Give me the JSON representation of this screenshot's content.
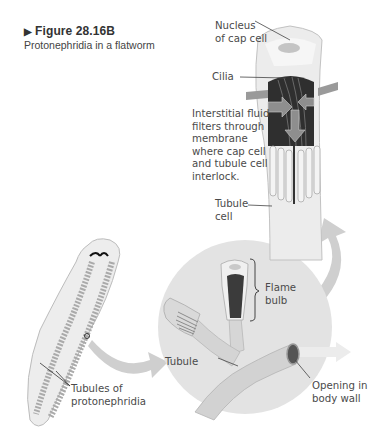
{
  "figure": {
    "number": "Figure 28.16B",
    "title": "Protonephridia in a flatworm"
  },
  "labels": {
    "nucleus_cap_cell": [
      "Nucleus",
      "of cap cell"
    ],
    "cilia": "Cilia",
    "filtration_note": [
      "Interstitial fluid",
      "filters through",
      "membrane",
      "where cap cell",
      "and tubule cell",
      "interlock."
    ],
    "tubule_cell": [
      "Tubule",
      "cell"
    ],
    "flame_bulb": [
      "Flame",
      "bulb"
    ],
    "tubule": "Tubule",
    "opening": [
      "Opening in",
      "body wall"
    ],
    "tubules_of_protonephridia": [
      "Tubules of",
      "protonephridia"
    ]
  },
  "colors": {
    "circle_bg": "#e2e2e2",
    "arrow_gray": "#c8c8c8",
    "bulb_dark": "#3a3a3a",
    "worm_fill": "#ececec",
    "worm_tubules": "#a9a9a9"
  }
}
